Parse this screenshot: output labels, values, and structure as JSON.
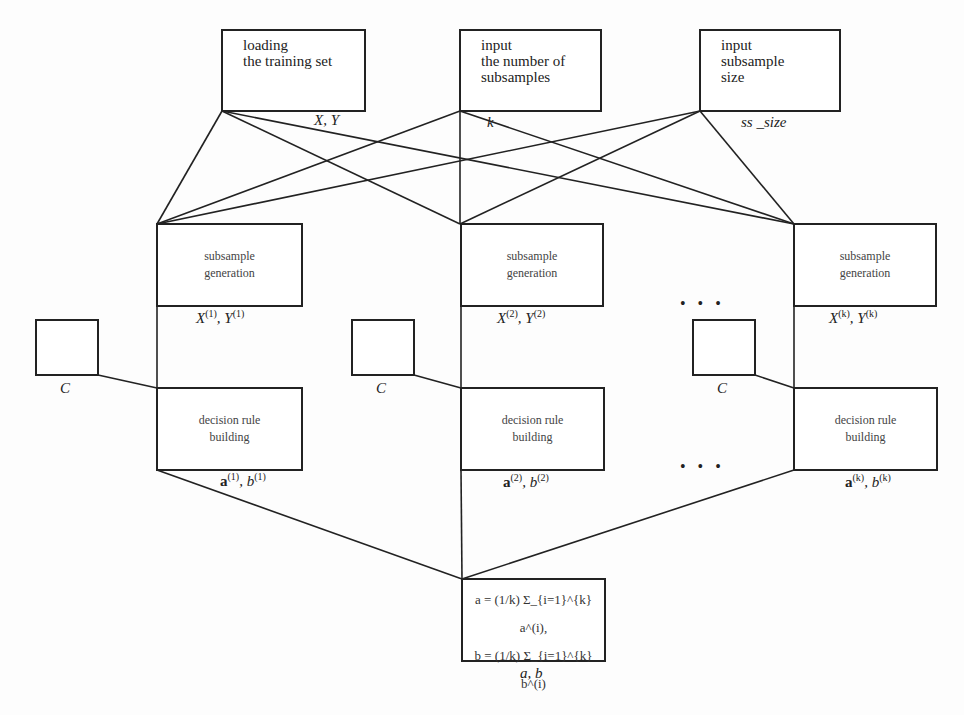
{
  "top_boxes": [
    {
      "label_lines": [
        "loading",
        "the training set"
      ],
      "output": "X, Y"
    },
    {
      "label_lines": [
        "input",
        "the number of",
        "subsamples"
      ],
      "output": "k"
    },
    {
      "label_lines": [
        "input",
        "subsample",
        "size"
      ],
      "output": "ss _size"
    }
  ],
  "branches": [
    {
      "gen_label": [
        "subsample",
        "generation"
      ],
      "gen_output": {
        "x": "X",
        "y": "Y",
        "idx": "(1)"
      },
      "c_label": "C",
      "rule_label": [
        "decision rule",
        "building"
      ],
      "rule_output": {
        "a": "a",
        "b": "b",
        "idx": "(1)"
      }
    },
    {
      "gen_label": [
        "subsample",
        "generation"
      ],
      "gen_output": {
        "x": "X",
        "y": "Y",
        "idx": "(2)"
      },
      "c_label": "C",
      "rule_label": [
        "decision rule",
        "building"
      ],
      "rule_output": {
        "a": "a",
        "b": "b",
        "idx": "(2)"
      }
    },
    {
      "gen_label": [
        "subsample",
        "generation"
      ],
      "gen_output": {
        "x": "X",
        "y": "Y",
        "idx": "(k)"
      },
      "c_label": "C",
      "rule_label": [
        "decision rule",
        "building"
      ],
      "rule_output": {
        "a": "a",
        "b": "b",
        "idx": "(k)"
      }
    }
  ],
  "ellipsis": "• • •",
  "aggregate": {
    "formula_a": "a = (1/k) Σ_{i=1}^{k} a^(i),",
    "formula_b": "b = (1/k) Σ_{i=1}^{k} b^(i)",
    "output": "a, b"
  }
}
